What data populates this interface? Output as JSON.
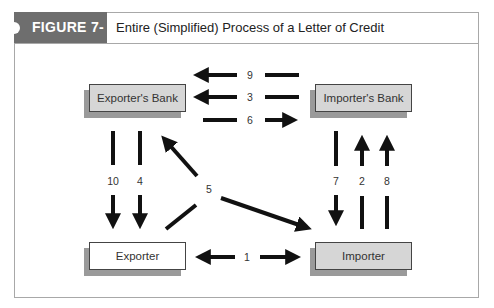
{
  "figure": {
    "tag": "FIGURE 7-4",
    "title": "Entire (Simplified) Process of a Letter of Credit"
  },
  "nodes": {
    "exporters_bank": "Exporter's Bank",
    "importers_bank": "Importer's Bank",
    "exporter": "Exporter",
    "importer": "Importer"
  },
  "steps": {
    "s1": "1",
    "s2": "2",
    "s3": "3",
    "s4": "4",
    "s5": "5",
    "s6": "6",
    "s7": "7",
    "s8": "8",
    "s9": "9",
    "s10": "10"
  },
  "edges": [
    {
      "step": "1",
      "from": "Importer",
      "to": "Exporter"
    },
    {
      "step": "2",
      "from": "Importer",
      "to": "Importer's Bank"
    },
    {
      "step": "3",
      "from": "Importer's Bank",
      "to": "Exporter's Bank"
    },
    {
      "step": "4",
      "from": "Exporter's Bank",
      "to": "Exporter"
    },
    {
      "step": "5",
      "from": "Exporter",
      "to": "Exporter's Bank / Importer"
    },
    {
      "step": "6",
      "from": "Exporter's Bank",
      "to": "Importer's Bank"
    },
    {
      "step": "7",
      "from": "Importer's Bank",
      "to": "Importer"
    },
    {
      "step": "8",
      "from": "Importer",
      "to": "Importer's Bank"
    },
    {
      "step": "9",
      "from": "Importer's Bank",
      "to": "Exporter's Bank"
    },
    {
      "step": "10",
      "from": "Exporter's Bank",
      "to": "Exporter"
    }
  ],
  "colors": {
    "header_tag": "#6e6e6e",
    "box_gray": "#d6d6d6",
    "shadow": "#9a9a9a",
    "arrow": "#111111"
  }
}
